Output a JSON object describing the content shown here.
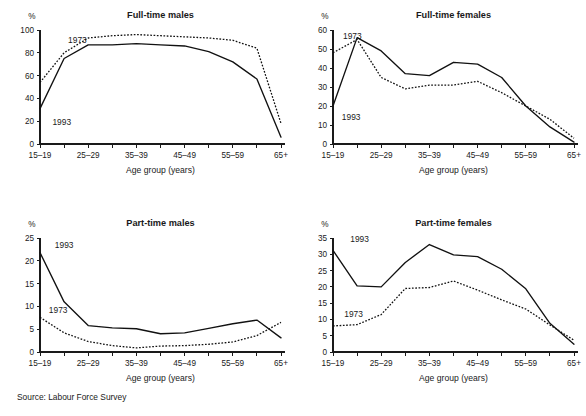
{
  "figure": {
    "source_note": "Source: Labour Force Survey",
    "xlabel": "Age group (years)",
    "unit_symbol": "%",
    "age_groups": [
      "15–19",
      "20–24",
      "25–29",
      "30–34",
      "35–39",
      "40–44",
      "45–49",
      "50–54",
      "55–59",
      "60–64",
      "65+"
    ],
    "tick_labels": [
      "15–19",
      "25–29",
      "35–39",
      "45–39",
      "55–59",
      "65+"
    ],
    "line_colour": "#111111"
  },
  "chart_data": [
    {
      "id": "full-time-males",
      "type": "line",
      "title": "Full-time males",
      "xlabel": "Age group (years)",
      "ylabel": "%",
      "ylim": [
        0,
        100
      ],
      "yticks": [
        0,
        20,
        40,
        60,
        80,
        100
      ],
      "grid": false,
      "legend_position": "inline-annotation",
      "x": [
        "15–19",
        "20–24",
        "25–29",
        "30–34",
        "35–39",
        "40–44",
        "45–49",
        "50–54",
        "55–59",
        "60–64",
        "65+"
      ],
      "series": [
        {
          "name": "1973",
          "style": "dotted",
          "label_x": 1,
          "label_y": 91,
          "values": [
            54,
            80,
            93,
            95,
            96,
            95,
            94,
            93,
            91,
            84,
            18
          ]
        },
        {
          "name": "1993",
          "style": "solid",
          "label_x": 0.35,
          "label_y": 19,
          "values": [
            31,
            75,
            87,
            87,
            88,
            87,
            86,
            81,
            72,
            57,
            6
          ]
        }
      ]
    },
    {
      "id": "full-time-females",
      "type": "line",
      "title": "Full-time females",
      "xlabel": "Age group (years)",
      "ylabel": "%",
      "ylim": [
        0,
        60
      ],
      "yticks": [
        0,
        10,
        20,
        30,
        40,
        50,
        60
      ],
      "grid": false,
      "legend_position": "inline-annotation",
      "x": [
        "15–19",
        "20–24",
        "25–29",
        "30–34",
        "35–39",
        "40–44",
        "45–49",
        "50–54",
        "55–59",
        "60–64",
        "65+"
      ],
      "series": [
        {
          "name": "1973",
          "style": "dotted",
          "label_x": 0.25,
          "label_y": 57,
          "values": [
            48,
            55,
            35,
            29,
            31,
            31,
            33,
            27,
            20,
            13,
            3
          ]
        },
        {
          "name": "1993",
          "style": "solid",
          "label_x": 0.2,
          "label_y": 14,
          "values": [
            20,
            56,
            49,
            37,
            36,
            43,
            42,
            35,
            20,
            9,
            1
          ]
        }
      ]
    },
    {
      "id": "part-time-males",
      "type": "line",
      "title": "Part-time males",
      "xlabel": "Age group (years)",
      "ylabel": "%",
      "ylim": [
        0,
        25
      ],
      "yticks": [
        0,
        5,
        10,
        15,
        20,
        25
      ],
      "grid": false,
      "legend_position": "inline-annotation",
      "x": [
        "15–19",
        "20–24",
        "25–29",
        "30–34",
        "35–39",
        "40–44",
        "45–49",
        "50–54",
        "55–59",
        "60–64",
        "65+"
      ],
      "series": [
        {
          "name": "1973",
          "style": "dotted",
          "label_x": 0.2,
          "label_y": 9.3,
          "values": [
            7.6,
            4.2,
            2.3,
            1.4,
            0.9,
            1.3,
            1.4,
            1.7,
            2.2,
            3.6,
            6.5
          ]
        },
        {
          "name": "1993",
          "style": "solid",
          "label_x": 0.45,
          "label_y": 23.4,
          "values": [
            21.8,
            11.0,
            5.8,
            5.3,
            5.1,
            4.0,
            4.2,
            5.2,
            6.2,
            7.0,
            3.1
          ]
        }
      ]
    },
    {
      "id": "part-time-females",
      "type": "line",
      "title": "Part-time females",
      "xlabel": "Age group (years)",
      "ylabel": "%",
      "ylim": [
        0,
        35
      ],
      "yticks": [
        0,
        5,
        10,
        15,
        20,
        25,
        30,
        35
      ],
      "grid": false,
      "legend_position": "inline-annotation",
      "x": [
        "15–19",
        "20–24",
        "25–29",
        "30–34",
        "35–39",
        "40–44",
        "45–49",
        "50–54",
        "55–59",
        "60–64",
        "65+"
      ],
      "series": [
        {
          "name": "1973",
          "style": "dotted",
          "label_x": 0.3,
          "label_y": 11.8,
          "values": [
            8.0,
            8.4,
            11.5,
            19.5,
            19.8,
            21.8,
            19.0,
            16.0,
            13.2,
            8.3,
            3.6
          ]
        },
        {
          "name": "1993",
          "style": "solid",
          "label_x": 0.55,
          "label_y": 34.6,
          "values": [
            31.2,
            20.3,
            20.0,
            27.5,
            33.0,
            29.8,
            29.3,
            25.4,
            19.4,
            8.8,
            2.4
          ]
        }
      ]
    }
  ]
}
